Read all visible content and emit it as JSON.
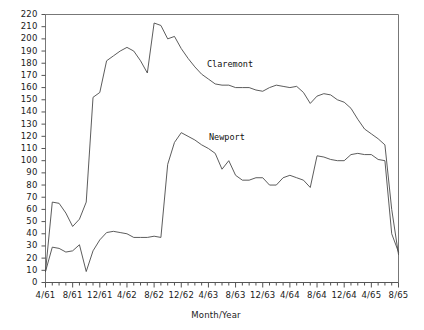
{
  "chart_data": {
    "type": "line",
    "title": "",
    "xlabel": "Month/Year",
    "ylabel": "",
    "ylim": [
      0,
      220
    ],
    "ytick_step": 10,
    "yticks": [
      0,
      10,
      20,
      30,
      40,
      50,
      60,
      70,
      80,
      90,
      100,
      110,
      120,
      130,
      140,
      150,
      160,
      170,
      180,
      190,
      200,
      210,
      220
    ],
    "grid": false,
    "legend_position": "inline-annotations",
    "x_tick_count": 53,
    "x_tick_labels": [
      "4/61",
      "8/61",
      "12/61",
      "4/62",
      "8/62",
      "12/62",
      "4/63",
      "8/63",
      "12/63",
      "4/64",
      "8/64",
      "12/64",
      "4/65",
      "8/65"
    ],
    "x_tick_label_interval": 4,
    "x": [
      "4/61",
      "5/61",
      "6/61",
      "7/61",
      "8/61",
      "9/61",
      "10/61",
      "11/61",
      "12/61",
      "1/62",
      "2/62",
      "3/62",
      "4/62",
      "5/62",
      "6/62",
      "7/62",
      "8/62",
      "9/62",
      "10/62",
      "11/62",
      "12/62",
      "1/63",
      "2/63",
      "3/63",
      "4/63",
      "5/63",
      "6/63",
      "7/63",
      "8/63",
      "9/63",
      "10/63",
      "11/63",
      "12/63",
      "1/64",
      "2/64",
      "3/64",
      "4/64",
      "5/64",
      "6/64",
      "7/64",
      "8/64",
      "9/64",
      "10/64",
      "11/64",
      "12/64",
      "1/65",
      "2/65",
      "3/65",
      "4/65",
      "5/65",
      "6/65",
      "7/65",
      "8/65"
    ],
    "series": [
      {
        "name": "Claremont",
        "color": "#4a4a4a",
        "values": [
          9,
          66,
          65,
          57,
          46,
          52,
          66,
          152,
          156,
          182,
          186,
          190,
          193,
          190,
          182,
          172,
          213,
          211,
          200,
          202,
          192,
          184,
          177,
          171,
          167,
          163,
          162,
          162,
          160,
          160,
          160,
          158,
          157,
          160,
          162,
          161,
          160,
          161,
          156,
          147,
          153,
          155,
          154,
          150,
          148,
          143,
          134,
          126,
          122,
          118,
          113,
          60,
          23
        ]
      },
      {
        "name": "Newport",
        "color": "#4a4a4a",
        "values": [
          9,
          29,
          28,
          25,
          26,
          31,
          9,
          26,
          35,
          41,
          42,
          41,
          40,
          37,
          37,
          37,
          38,
          37,
          97,
          115,
          123,
          120,
          117,
          113,
          110,
          106,
          93,
          100,
          88,
          84,
          84,
          86,
          86,
          80,
          80,
          86,
          88,
          86,
          84,
          78,
          104,
          103,
          101,
          100,
          100,
          105,
          106,
          105,
          105,
          101,
          100,
          40,
          25
        ]
      }
    ],
    "annotations": [
      {
        "text": "Claremont",
        "x_px": 207,
        "y_px": 59
      },
      {
        "text": "Newport",
        "x_px": 209,
        "y_px": 132
      }
    ]
  },
  "axis": {
    "x_title": "Month/Year"
  }
}
